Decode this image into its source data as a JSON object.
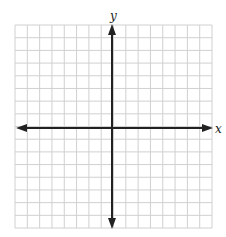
{
  "diagram": {
    "type": "coordinate-plane",
    "x_axis_label": "x",
    "y_axis_label": "y",
    "grid": {
      "columns": 16,
      "rows": 16,
      "left": 15,
      "top": 25,
      "right": 212,
      "bottom": 228,
      "line_color": "#d0d0d0",
      "axis_color": "#222222"
    },
    "origin": {
      "x": 112,
      "y": 128
    }
  }
}
